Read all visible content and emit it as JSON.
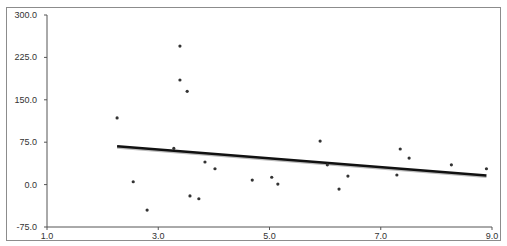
{
  "chart_data": {
    "type": "scatter",
    "title": "",
    "xlabel": "",
    "ylabel": "",
    "xlim": [
      1.0,
      9.0
    ],
    "ylim": [
      -75.0,
      300.0
    ],
    "x_ticks": [
      "1.0",
      "3.0",
      "5.0",
      "7.0",
      "9.0"
    ],
    "y_ticks": [
      "300.0",
      "225.0",
      "150.0",
      "75.0",
      "0.0",
      "-75.0"
    ],
    "grid": false,
    "legend": null,
    "series": [
      {
        "name": "data",
        "type": "scatter",
        "color": "#333333",
        "points": [
          [
            2.26,
            118
          ],
          [
            2.55,
            5
          ],
          [
            2.8,
            -45
          ],
          [
            3.28,
            64
          ],
          [
            3.39,
            245
          ],
          [
            3.39,
            185
          ],
          [
            3.52,
            165
          ],
          [
            3.57,
            -20
          ],
          [
            3.73,
            -25
          ],
          [
            3.84,
            40
          ],
          [
            4.02,
            28
          ],
          [
            4.69,
            8
          ],
          [
            5.04,
            13
          ],
          [
            5.15,
            1
          ],
          [
            5.91,
            77
          ],
          [
            6.04,
            35
          ],
          [
            6.25,
            -8
          ],
          [
            6.41,
            15
          ],
          [
            7.29,
            17
          ],
          [
            7.35,
            63
          ],
          [
            7.51,
            47
          ],
          [
            8.27,
            35
          ],
          [
            8.9,
            28
          ]
        ]
      },
      {
        "name": "trendline",
        "type": "line",
        "color": "#111111",
        "points": [
          [
            2.26,
            68
          ],
          [
            8.9,
            16
          ]
        ]
      }
    ]
  }
}
